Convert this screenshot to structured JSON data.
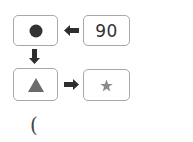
{
  "diagram": {
    "nodes": [
      {
        "id": "circle",
        "shape": "circle",
        "color": "#3a3a3a"
      },
      {
        "id": "number",
        "value": "90"
      },
      {
        "id": "triangle",
        "shape": "triangle",
        "color": "#6a6a6a"
      },
      {
        "id": "star",
        "shape": "star",
        "color": "#8a8a8a"
      }
    ],
    "edges": [
      {
        "from": "number",
        "to": "circle",
        "direction": "left"
      },
      {
        "from": "circle",
        "to": "triangle",
        "direction": "down"
      },
      {
        "from": "triangle",
        "to": "star",
        "direction": "right"
      }
    ],
    "number_label": "90",
    "footer_text": "("
  }
}
